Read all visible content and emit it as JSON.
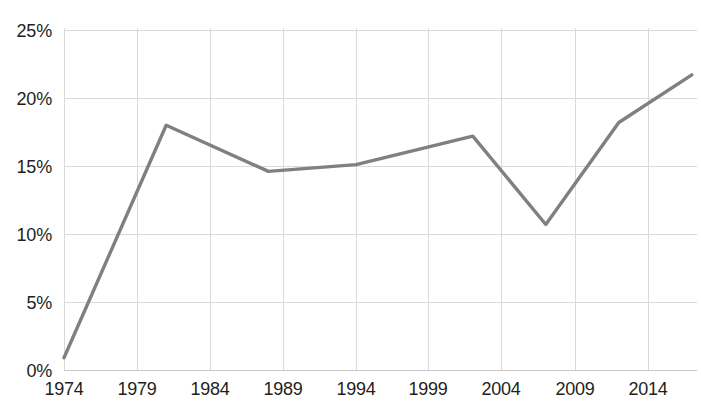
{
  "chart_data": {
    "type": "line",
    "title": "",
    "subtitle": "",
    "xlabel": "",
    "ylabel": "",
    "grid": true,
    "legend": false,
    "legend_position": "none",
    "line_color": "#808080",
    "grid_color": "#d9d9d9",
    "text_color": "#231f20",
    "xlim": [
      1974,
      2017
    ],
    "ylim": [
      0,
      25
    ],
    "x_tick_labels": [
      "1974",
      "1979",
      "1984",
      "1989",
      "1994",
      "1999",
      "2004",
      "2009",
      "2014"
    ],
    "x_ticks": [
      1974,
      1979,
      1984,
      1989,
      1994,
      1999,
      2004,
      2009,
      2014
    ],
    "y_tick_labels": [
      "0%",
      "5%",
      "10%",
      "15%",
      "20%",
      "25%"
    ],
    "y_ticks": [
      0,
      5,
      10,
      15,
      20,
      25
    ],
    "series": [
      {
        "name": "series-1",
        "x": [
          1974,
          1981,
          1988,
          1994,
          2002,
          2007,
          2012,
          2017
        ],
        "values": [
          0.9,
          18.0,
          14.6,
          15.1,
          17.2,
          10.7,
          18.2,
          21.7
        ]
      }
    ]
  }
}
